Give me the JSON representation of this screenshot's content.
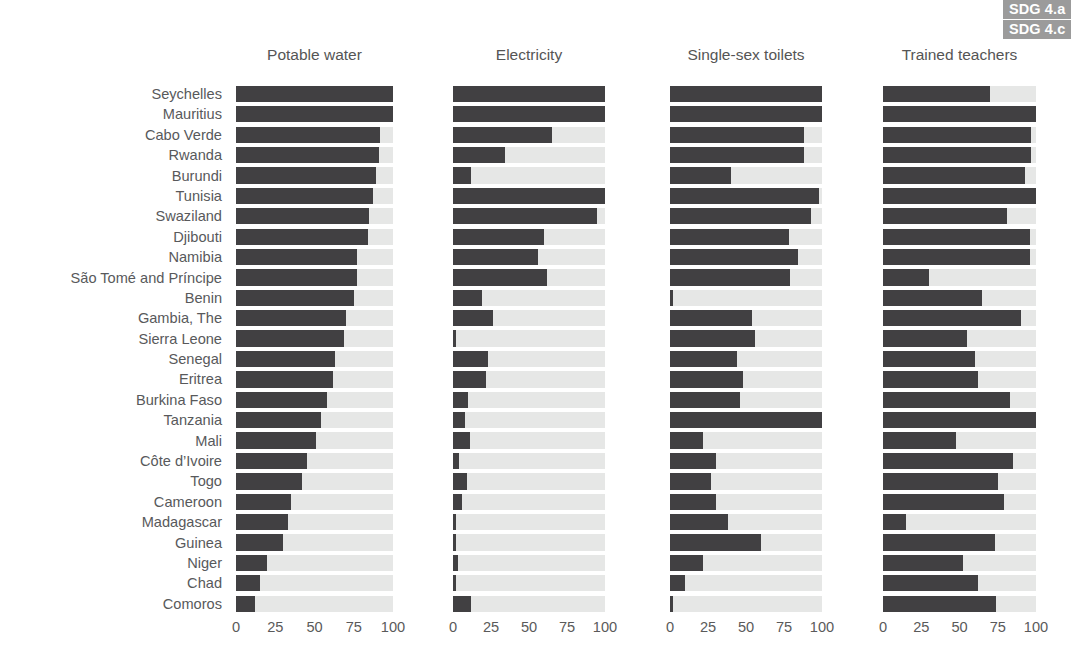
{
  "badges": [
    {
      "label": "SDG 4.a"
    },
    {
      "label": "SDG 4.c"
    }
  ],
  "colors": {
    "bar_fill": "#414042",
    "bar_track": "#e6e7e6",
    "badge_bg": "#9b9b9b",
    "badge_text": "#ffffff",
    "label_text": "#58595b"
  },
  "chart_data": {
    "type": "bar",
    "title": "",
    "orientation": "horizontal",
    "grid": false,
    "legend": [
      "SDG 4.a",
      "SDG 4.c"
    ],
    "legend_position": "top-right",
    "xlabel": "",
    "ylabel": "",
    "xlim": [
      0,
      100
    ],
    "xticks": [
      0,
      25,
      50,
      75,
      100
    ],
    "xtick_labels": [
      "0",
      "25",
      "50",
      "75",
      "100"
    ],
    "categories": [
      "Seychelles",
      "Mauritius",
      "Cabo Verde",
      "Rwanda",
      "Burundi",
      "Tunisia",
      "Swaziland",
      "Djibouti",
      "Namibia",
      "São Tomé and Príncipe",
      "Benin",
      "Gambia, The",
      "Sierra Leone",
      "Senegal",
      "Eritrea",
      "Burkina Faso",
      "Tanzania",
      "Mali",
      "Côte d’Ivoire",
      "Togo",
      "Cameroon",
      "Madagascar",
      "Guinea",
      "Niger",
      "Chad",
      "Comoros"
    ],
    "series": [
      {
        "name": "Potable water",
        "values": [
          100,
          100,
          92,
          91,
          89,
          87,
          85,
          84,
          77,
          77,
          75,
          70,
          69,
          63,
          62,
          58,
          54,
          51,
          45,
          42,
          35,
          33,
          30,
          20,
          15,
          12
        ]
      },
      {
        "name": "Electricity",
        "values": [
          100,
          100,
          65,
          34,
          12,
          100,
          95,
          60,
          56,
          62,
          19,
          26,
          2,
          23,
          22,
          10,
          8,
          11,
          4,
          9,
          6,
          2,
          2,
          3,
          2,
          12
        ]
      },
      {
        "name": "Single-sex toilets",
        "values": [
          100,
          100,
          88,
          88,
          40,
          98,
          93,
          78,
          84,
          79,
          2,
          54,
          56,
          44,
          48,
          46,
          100,
          22,
          30,
          27,
          30,
          38,
          60,
          22,
          10,
          2
        ]
      },
      {
        "name": "Trained teachers",
        "values": [
          70,
          100,
          97,
          97,
          93,
          100,
          81,
          96,
          96,
          30,
          65,
          90,
          55,
          60,
          62,
          83,
          100,
          48,
          85,
          75,
          79,
          15,
          73,
          52,
          62,
          74
        ]
      }
    ]
  }
}
